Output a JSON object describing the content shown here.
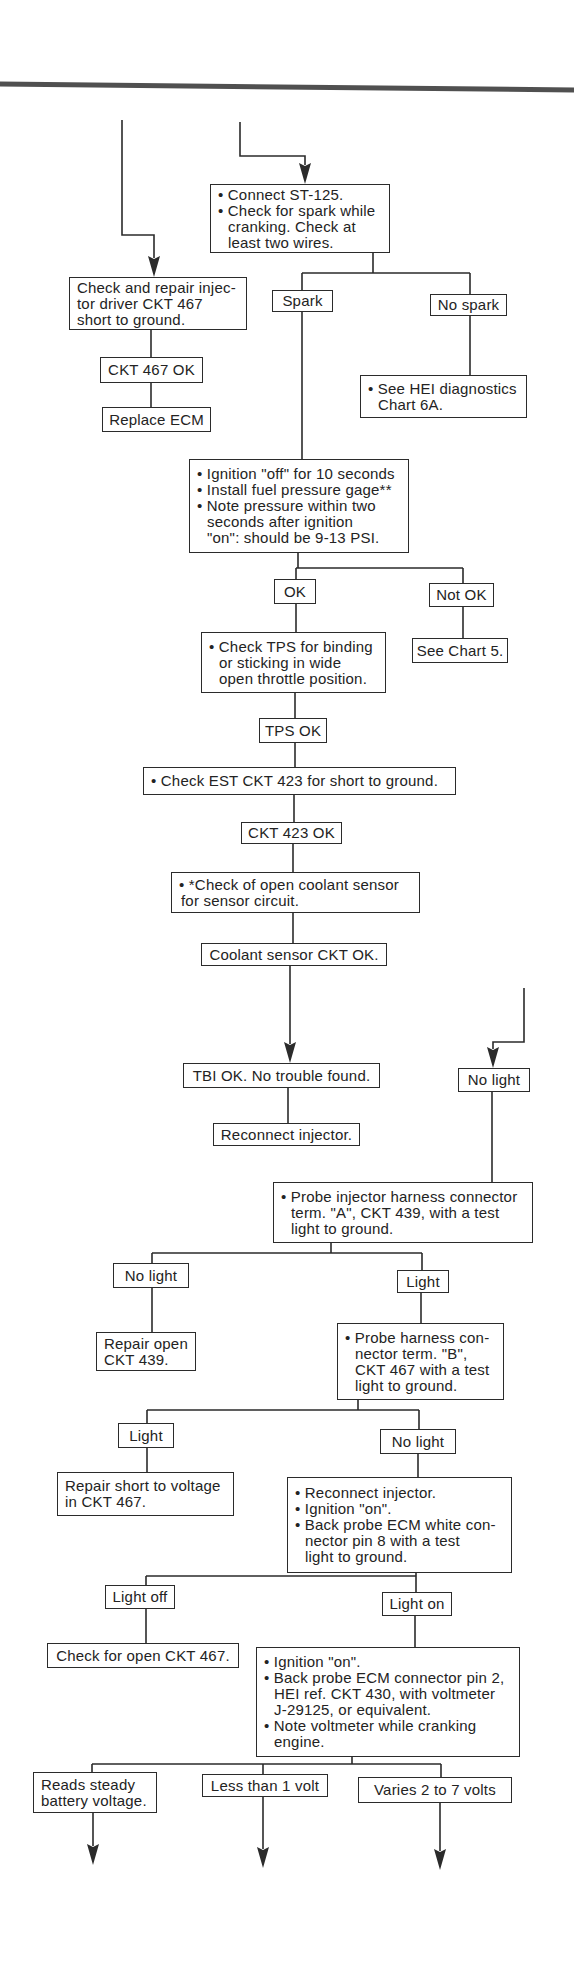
{
  "diagram": {
    "type": "flowchart",
    "colors": {
      "ink": "#2b2b2b",
      "paper": "#ffffff",
      "rule": "#505050"
    },
    "nodes": {
      "connect_st125": {
        "lines": [
          "• Connect ST-125.",
          "• Check for spark while",
          "cranking. Check at",
          "least two wires."
        ]
      },
      "repair_ckt467_short": {
        "lines": [
          "Check and repair injec-",
          "tor driver CKT 467",
          "short to ground."
        ]
      },
      "ckt467_ok": {
        "lines": [
          "CKT 467 OK"
        ]
      },
      "replace_ecm": {
        "lines": [
          "Replace ECM"
        ]
      },
      "spark": {
        "lines": [
          "Spark"
        ]
      },
      "no_spark": {
        "lines": [
          "No spark"
        ]
      },
      "see_hei": {
        "lines": [
          "• See HEI diagnostics",
          "Chart 6A."
        ]
      },
      "ignition_off": {
        "lines": [
          "• Ignition \"off\" for 10 seconds",
          "• Install fuel pressure gage**",
          "• Note pressure within two",
          "seconds after ignition",
          "\"on\": should be 9-13 PSI."
        ]
      },
      "ok": {
        "lines": [
          "OK"
        ]
      },
      "not_ok": {
        "lines": [
          "Not OK"
        ]
      },
      "see_chart5": {
        "lines": [
          "See Chart 5."
        ]
      },
      "check_tps": {
        "lines": [
          "• Check TPS for binding",
          "or sticking in wide",
          "open throttle position."
        ]
      },
      "tps_ok": {
        "lines": [
          "TPS OK"
        ]
      },
      "check_est": {
        "lines": [
          "• Check EST CKT 423 for short to ground."
        ]
      },
      "ckt423_ok": {
        "lines": [
          "CKT 423 OK"
        ]
      },
      "check_coolant": {
        "lines": [
          "•  *Check of open coolant sensor",
          "for sensor circuit."
        ]
      },
      "coolant_ok": {
        "lines": [
          "Coolant sensor CKT OK."
        ]
      },
      "tbi_ok": {
        "lines": [
          "TBI OK. No trouble found."
        ]
      },
      "no_light_a": {
        "lines": [
          "No light"
        ]
      },
      "reconnect_injector": {
        "lines": [
          "Reconnect injector."
        ]
      },
      "probe_term_a": {
        "lines": [
          "• Probe injector harness connector",
          "term. \"A\", CKT 439, with a test",
          "light to ground."
        ]
      },
      "no_light_b": {
        "lines": [
          "No light"
        ]
      },
      "light_b": {
        "lines": [
          "Light"
        ]
      },
      "repair_open_439": {
        "lines": [
          "Repair open",
          "CKT 439."
        ]
      },
      "probe_term_b": {
        "lines": [
          "• Probe harness con-",
          "nector term. \"B\",",
          "CKT 467 with a test",
          "light to ground."
        ]
      },
      "light_c": {
        "lines": [
          "Light"
        ]
      },
      "no_light_c": {
        "lines": [
          "No light"
        ]
      },
      "repair_short_467": {
        "lines": [
          "Repair short to voltage",
          "in CKT 467."
        ]
      },
      "back_probe_pin8": {
        "lines": [
          "• Reconnect injector.",
          "• Ignition \"on\".",
          "• Back probe ECM white con-",
          "nector pin 8 with a test",
          "light to ground."
        ]
      },
      "light_off": {
        "lines": [
          "Light off"
        ]
      },
      "light_on": {
        "lines": [
          "Light on"
        ]
      },
      "check_open_467": {
        "lines": [
          "Check for open CKT 467."
        ]
      },
      "back_probe_pin2": {
        "lines": [
          "• Ignition \"on\".",
          "• Back probe ECM connector pin 2,",
          "HEI ref. CKT 430, with voltmeter",
          "J-29125, or equivalent.",
          "• Note voltmeter while cranking",
          "engine."
        ]
      },
      "steady_battery": {
        "lines": [
          "Reads steady",
          "battery voltage."
        ]
      },
      "less_than_1v": {
        "lines": [
          "Less than 1 volt"
        ]
      },
      "varies_2_7v": {
        "lines": [
          "Varies 2 to 7 volts"
        ]
      }
    },
    "edges": [
      [
        "incoming_left",
        "repair_ckt467_short"
      ],
      [
        "incoming_top",
        "connect_st125"
      ],
      [
        "connect_st125",
        "spark"
      ],
      [
        "connect_st125",
        "no_spark"
      ],
      [
        "no_spark",
        "see_hei"
      ],
      [
        "repair_ckt467_short",
        "ckt467_ok"
      ],
      [
        "ckt467_ok",
        "replace_ecm"
      ],
      [
        "spark",
        "ignition_off"
      ],
      [
        "ignition_off",
        "ok"
      ],
      [
        "ignition_off",
        "not_ok"
      ],
      [
        "not_ok",
        "see_chart5"
      ],
      [
        "ok",
        "check_tps"
      ],
      [
        "check_tps",
        "tps_ok"
      ],
      [
        "tps_ok",
        "check_est"
      ],
      [
        "check_est",
        "ckt423_ok"
      ],
      [
        "ckt423_ok",
        "check_coolant"
      ],
      [
        "check_coolant",
        "coolant_ok"
      ],
      [
        "coolant_ok",
        "tbi_ok"
      ],
      [
        "tbi_ok",
        "reconnect_injector"
      ],
      [
        "incoming_right",
        "no_light_a"
      ],
      [
        "no_light_a",
        "probe_term_a"
      ],
      [
        "probe_term_a",
        "no_light_b"
      ],
      [
        "probe_term_a",
        "light_b"
      ],
      [
        "no_light_b",
        "repair_open_439"
      ],
      [
        "light_b",
        "probe_term_b"
      ],
      [
        "probe_term_b",
        "light_c"
      ],
      [
        "probe_term_b",
        "no_light_c"
      ],
      [
        "light_c",
        "repair_short_467"
      ],
      [
        "no_light_c",
        "back_probe_pin8"
      ],
      [
        "back_probe_pin8",
        "light_off"
      ],
      [
        "back_probe_pin8",
        "light_on"
      ],
      [
        "light_off",
        "check_open_467"
      ],
      [
        "light_on",
        "back_probe_pin2"
      ],
      [
        "back_probe_pin2",
        "steady_battery"
      ],
      [
        "back_probe_pin2",
        "less_than_1v"
      ],
      [
        "back_probe_pin2",
        "varies_2_7v"
      ],
      [
        "steady_battery",
        "continues_below"
      ],
      [
        "less_than_1v",
        "continues_below"
      ],
      [
        "varies_2_7v",
        "continues_below"
      ]
    ]
  }
}
